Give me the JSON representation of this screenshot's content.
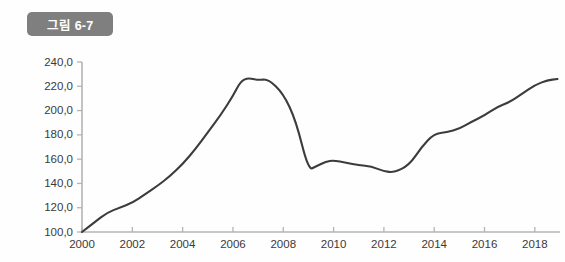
{
  "figure": {
    "badge_label": "그림 6-7",
    "badge_color": "#7f7f7f",
    "badge_text_color": "#ffffff",
    "background_color": "#fefefe"
  },
  "chart_data": {
    "type": "line",
    "title": "",
    "xlabel": "",
    "ylabel": "",
    "xlim": [
      2000,
      2019
    ],
    "ylim": [
      100,
      240
    ],
    "grid": false,
    "legend": null,
    "line_color": "#3c3c3c",
    "axis_color": "#b4b4b4",
    "decimal_separator": ",",
    "ytick_labels": [
      "100,0",
      "120,0",
      "140,0",
      "160,0",
      "180,0",
      "200,0",
      "220,0",
      "240,0"
    ],
    "ytick_values": [
      100,
      120,
      140,
      160,
      180,
      200,
      220,
      240
    ],
    "xtick_labels": [
      "2000",
      "2002",
      "2004",
      "2006",
      "2008",
      "2010",
      "2012",
      "2014",
      "2016",
      "2018"
    ],
    "xtick_values": [
      2000,
      2002,
      2004,
      2006,
      2008,
      2010,
      2012,
      2014,
      2016,
      2018
    ],
    "series": [
      {
        "name": "index",
        "x": [
          2000.0,
          2000.5,
          2001.0,
          2001.5,
          2002.0,
          2002.5,
          2003.0,
          2003.5,
          2004.0,
          2004.5,
          2005.0,
          2005.5,
          2006.0,
          2006.3,
          2006.6,
          2007.0,
          2007.4,
          2008.0,
          2008.5,
          2009.0,
          2009.3,
          2009.7,
          2010.0,
          2010.5,
          2011.0,
          2011.5,
          2012.0,
          2012.4,
          2013.0,
          2013.5,
          2014.0,
          2014.5,
          2015.0,
          2015.5,
          2016.0,
          2016.5,
          2017.0,
          2017.5,
          2018.0,
          2018.5,
          2018.9
        ],
        "values": [
          100.0,
          108.0,
          116.0,
          120.0,
          124.0,
          131.0,
          138.0,
          146.0,
          156.0,
          168.0,
          182.0,
          196.0,
          212.0,
          224.0,
          227.0,
          225.0,
          226.0,
          214.0,
          192.0,
          151.0,
          154.0,
          158.0,
          159.0,
          157.0,
          155.0,
          154.0,
          150.0,
          149.0,
          155.0,
          170.0,
          181.0,
          182.0,
          185.0,
          191.0,
          196.0,
          203.0,
          207.0,
          214.0,
          221.0,
          225.0,
          226.0
        ]
      }
    ]
  }
}
